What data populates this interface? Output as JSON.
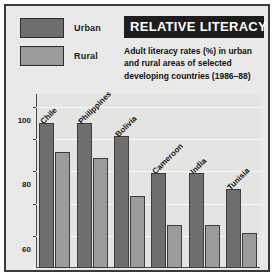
{
  "header": {
    "title": "RELATIVE LITERACY",
    "subtitle": "Adult literacy rates (%) in urban and rural areas of selected developing countries (1986–88)"
  },
  "legend": {
    "items": [
      {
        "label": "Urban",
        "color": "#6e6e6e"
      },
      {
        "label": "Rural",
        "color": "#9b9b9b"
      }
    ]
  },
  "axis": {
    "yticks": [
      "20",
      "40",
      "60",
      "80",
      "100"
    ]
  },
  "chart_data": {
    "type": "bar",
    "title": "RELATIVE LITERACY",
    "subtitle": "Adult literacy rates (%) in urban and rural areas of selected developing countries (1986–88)",
    "xlabel": "",
    "ylabel": "",
    "ylim": [
      0,
      108
    ],
    "yticks": [
      20,
      40,
      60,
      80,
      100
    ],
    "grid": true,
    "legend_position": "top-left",
    "categories": [
      "Chile",
      "Philippines",
      "Bolivia",
      "Cameroon",
      "India",
      "Tunisia"
    ],
    "series": [
      {
        "name": "Urban",
        "color": "#6e6e6e",
        "values": [
          90,
          90,
          82,
          59,
          59,
          49
        ]
      },
      {
        "name": "Rural",
        "color": "#9b9b9b",
        "values": [
          72,
          68,
          45,
          27,
          27,
          22
        ]
      }
    ]
  }
}
